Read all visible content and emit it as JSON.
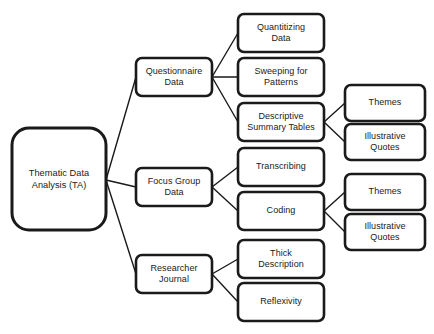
{
  "diagram": {
    "background_color": "#ffffff",
    "line_color": "#1a1a1a",
    "box_fill": "#ffffff",
    "nodes": [
      {
        "id": "root",
        "label": "Thematic Data\nAnalysis (TA)",
        "level": 1,
        "x": 12,
        "y": 128,
        "w": 94,
        "h": 102,
        "rx": 17
      },
      {
        "id": "questionnaire-data",
        "label": "Questionnaire\nData",
        "level": 2,
        "x": 136,
        "y": 58,
        "w": 76,
        "h": 38,
        "rx": 6
      },
      {
        "id": "focus-group-data",
        "label": "Focus Group\nData",
        "level": 2,
        "x": 136,
        "y": 168,
        "w": 76,
        "h": 38,
        "rx": 6
      },
      {
        "id": "researcher-journal",
        "label": "Researcher\nJournal",
        "level": 2,
        "x": 136,
        "y": 255,
        "w": 76,
        "h": 38,
        "rx": 6
      },
      {
        "id": "quantitizing-data",
        "label": "Quantitizing\nData",
        "level": 3,
        "x": 238,
        "y": 14,
        "w": 86,
        "h": 38,
        "rx": 6
      },
      {
        "id": "sweeping-for-patterns",
        "label": "Sweeping for\nPatterns",
        "level": 3,
        "x": 238,
        "y": 58,
        "w": 86,
        "h": 38,
        "rx": 6
      },
      {
        "id": "descriptive-summary-tables",
        "label": "Descriptive\nSummary Tables",
        "level": 3,
        "x": 238,
        "y": 103,
        "w": 86,
        "h": 38,
        "rx": 6
      },
      {
        "id": "transcribing",
        "label": "Transcribing",
        "level": 3,
        "x": 238,
        "y": 148,
        "w": 86,
        "h": 38,
        "rx": 6
      },
      {
        "id": "coding",
        "label": "Coding",
        "level": 3,
        "x": 238,
        "y": 192,
        "w": 86,
        "h": 38,
        "rx": 6
      },
      {
        "id": "thick-description",
        "label": "Thick\nDescription",
        "level": 3,
        "x": 238,
        "y": 240,
        "w": 86,
        "h": 38,
        "rx": 6
      },
      {
        "id": "reflexivity",
        "label": "Reflexivity",
        "level": 3,
        "x": 238,
        "y": 283,
        "w": 86,
        "h": 38,
        "rx": 6
      },
      {
        "id": "themes-1",
        "label": "Themes",
        "level": 4,
        "x": 345,
        "y": 85,
        "w": 80,
        "h": 36,
        "rx": 6
      },
      {
        "id": "illustrative-quotes-1",
        "label": "Illustrative\nQuotes",
        "level": 4,
        "x": 345,
        "y": 124,
        "w": 80,
        "h": 36,
        "rx": 6
      },
      {
        "id": "themes-2",
        "label": "Themes",
        "level": 4,
        "x": 345,
        "y": 174,
        "w": 80,
        "h": 36,
        "rx": 6
      },
      {
        "id": "illustrative-quotes-2",
        "label": "Illustrative\nQuotes",
        "level": 4,
        "x": 345,
        "y": 214,
        "w": 80,
        "h": 36,
        "rx": 6
      }
    ],
    "connectors": [
      {
        "id": "root-to-questionnaire",
        "from": "root",
        "to": "questionnaire-data",
        "x1": 106,
        "y1": 180,
        "x2": 136,
        "y2": 77
      },
      {
        "id": "root-to-focus-group",
        "from": "root",
        "to": "focus-group-data",
        "x1": 106,
        "y1": 180,
        "x2": 136,
        "y2": 187
      },
      {
        "id": "root-to-researcher-journal",
        "from": "root",
        "to": "researcher-journal",
        "x1": 106,
        "y1": 180,
        "x2": 136,
        "y2": 274
      },
      {
        "id": "questionnaire-to-quantitizing",
        "from": "questionnaire-data",
        "to": "quantitizing-data",
        "x1": 212,
        "y1": 77,
        "x2": 238,
        "y2": 33
      },
      {
        "id": "questionnaire-to-sweeping",
        "from": "questionnaire-data",
        "to": "sweeping-for-patterns",
        "x1": 212,
        "y1": 77,
        "x2": 238,
        "y2": 77
      },
      {
        "id": "questionnaire-to-descriptive",
        "from": "questionnaire-data",
        "to": "descriptive-summary-tables",
        "x1": 212,
        "y1": 77,
        "x2": 238,
        "y2": 122
      },
      {
        "id": "focus-group-to-transcribing",
        "from": "focus-group-data",
        "to": "transcribing",
        "x1": 212,
        "y1": 187,
        "x2": 238,
        "y2": 167
      },
      {
        "id": "focus-group-to-coding",
        "from": "focus-group-data",
        "to": "coding",
        "x1": 212,
        "y1": 187,
        "x2": 238,
        "y2": 211
      },
      {
        "id": "journal-to-thick-description",
        "from": "researcher-journal",
        "to": "thick-description",
        "x1": 212,
        "y1": 274,
        "x2": 238,
        "y2": 259
      },
      {
        "id": "journal-to-reflexivity",
        "from": "researcher-journal",
        "to": "reflexivity",
        "x1": 212,
        "y1": 274,
        "x2": 238,
        "y2": 302
      },
      {
        "id": "descriptive-to-themes-1",
        "from": "descriptive-summary-tables",
        "to": "themes-1",
        "x1": 324,
        "y1": 122,
        "x2": 345,
        "y2": 103
      },
      {
        "id": "descriptive-to-quotes-1",
        "from": "descriptive-summary-tables",
        "to": "illustrative-quotes-1",
        "x1": 324,
        "y1": 122,
        "x2": 345,
        "y2": 142
      },
      {
        "id": "coding-to-themes-2",
        "from": "coding",
        "to": "themes-2",
        "x1": 324,
        "y1": 211,
        "x2": 345,
        "y2": 192
      },
      {
        "id": "coding-to-quotes-2",
        "from": "coding",
        "to": "illustrative-quotes-2",
        "x1": 324,
        "y1": 211,
        "x2": 345,
        "y2": 232
      }
    ]
  }
}
